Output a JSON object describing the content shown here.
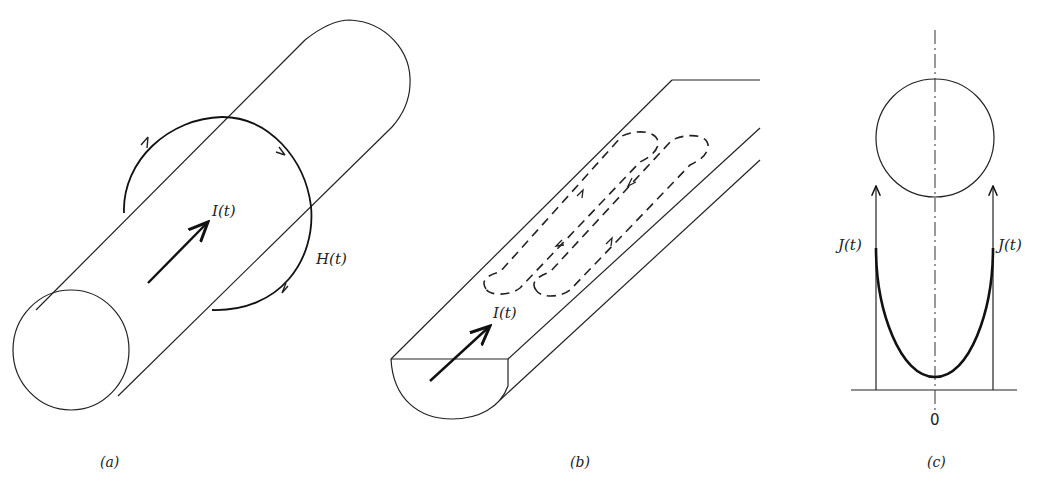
{
  "figure": {
    "panels": [
      {
        "id": "a",
        "caption": "(a)",
        "description": "Cylindrical conductor carrying current I(t) with circulating magnetic field H(t)",
        "labels": {
          "current": "I(t)",
          "field": "H(t)"
        }
      },
      {
        "id": "b",
        "caption": "(b)",
        "description": "Half-cylinder conductor with eddy-current loops (dashed) induced on the flat face",
        "labels": {
          "current": "I(t)"
        }
      },
      {
        "id": "c",
        "caption": "(c)",
        "description": "Cross-section of conductor with current density J(t) distribution, minimum at center",
        "labels": {
          "density_left": "J(t)",
          "density_right": "J(t)",
          "origin": "0"
        }
      }
    ]
  }
}
